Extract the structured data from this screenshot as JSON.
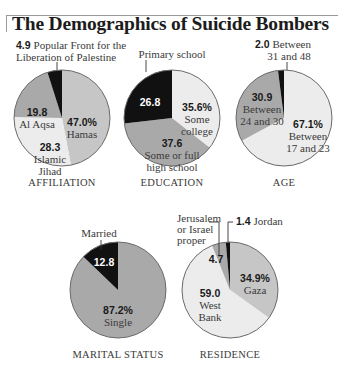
{
  "title": "The Demographics of Suicide Bombers",
  "colors": {
    "black": "#111111",
    "dark_gray": "#a9a9a9",
    "mid_gray": "#c6c6c6",
    "light_gray": "#ececec",
    "stroke": "#6a6a6a"
  },
  "chart_data": [
    {
      "type": "pie",
      "title": "AFFILIATION",
      "unit": "%",
      "center": [
        62,
        118
      ],
      "radius": 48,
      "slices": [
        {
          "name": "Hamas",
          "value": 47.0,
          "display": "47.0%",
          "label_lines": [
            "Hamas"
          ],
          "color": "#c6c6c6"
        },
        {
          "name": "Islamic Jihad",
          "value": 28.3,
          "display": "28.3",
          "label_lines": [
            "Islamic",
            "Jihad"
          ],
          "color": "#ececec"
        },
        {
          "name": "Al Aqsa",
          "value": 19.8,
          "display": "19.8",
          "label_lines": [
            "Al Aqsa"
          ],
          "color": "#a9a9a9"
        },
        {
          "name": "Popular Front for the Liberation of Palestine",
          "value": 4.9,
          "display": "4.9",
          "label_lines": [
            "Popular Front for the",
            "Liberation of Palestine"
          ],
          "color": "#111111"
        }
      ]
    },
    {
      "type": "pie",
      "title": "EDUCATION",
      "unit": "%",
      "center": [
        172,
        118
      ],
      "radius": 48,
      "slices": [
        {
          "name": "Some college",
          "value": 35.6,
          "display": "35.6%",
          "label_lines": [
            "Some",
            "college"
          ],
          "color": "#ececec"
        },
        {
          "name": "Some or full high school",
          "value": 37.6,
          "display": "37.6",
          "label_lines": [
            "Some or full",
            "high school"
          ],
          "color": "#a9a9a9"
        },
        {
          "name": "Primary school",
          "value": 26.8,
          "display": "26.8",
          "label_lines": [
            "Primary school"
          ],
          "color": "#111111"
        }
      ]
    },
    {
      "type": "pie",
      "title": "AGE",
      "unit": "%",
      "center": [
        284,
        118
      ],
      "radius": 48,
      "slices": [
        {
          "name": "Between 17 and 23",
          "value": 67.1,
          "display": "67.1%",
          "label_lines": [
            "Between",
            "17 and 23"
          ],
          "color": "#ececec"
        },
        {
          "name": "Between 24 and 30",
          "value": 30.9,
          "display": "30.9",
          "label_lines": [
            "Between",
            "24 and 30"
          ],
          "color": "#a9a9a9"
        },
        {
          "name": "Between 31 and 48",
          "value": 2.0,
          "display": "2.0",
          "label_lines": [
            "Between",
            "31 and 48"
          ],
          "color": "#111111"
        }
      ]
    },
    {
      "type": "pie",
      "title": "MARITAL STATUS",
      "unit": "%",
      "center": [
        118,
        290
      ],
      "radius": 48,
      "slices": [
        {
          "name": "Single",
          "value": 87.2,
          "display": "87.2%",
          "label_lines": [
            "Single"
          ],
          "color": "#a9a9a9"
        },
        {
          "name": "Married",
          "value": 12.8,
          "display": "12.8",
          "label_lines": [
            "Married"
          ],
          "color": "#111111"
        }
      ]
    },
    {
      "type": "pie",
      "title": "RESIDENCE",
      "unit": "%",
      "center": [
        230,
        290
      ],
      "radius": 48,
      "slices": [
        {
          "name": "Gaza",
          "value": 34.9,
          "display": "34.9%",
          "label_lines": [
            "Gaza"
          ],
          "color": "#c6c6c6"
        },
        {
          "name": "West Bank",
          "value": 59.0,
          "display": "59.0",
          "label_lines": [
            "West",
            "Bank"
          ],
          "color": "#ececec"
        },
        {
          "name": "Jerusalem or Israel proper",
          "value": 4.7,
          "display": "4.7",
          "label_lines": [
            "Jerusalem",
            "or Israel",
            "proper"
          ],
          "color": "#a9a9a9"
        },
        {
          "name": "Jordan",
          "value": 1.4,
          "display": "1.4",
          "label_lines": [
            "Jordan"
          ],
          "color": "#111111"
        }
      ]
    }
  ]
}
